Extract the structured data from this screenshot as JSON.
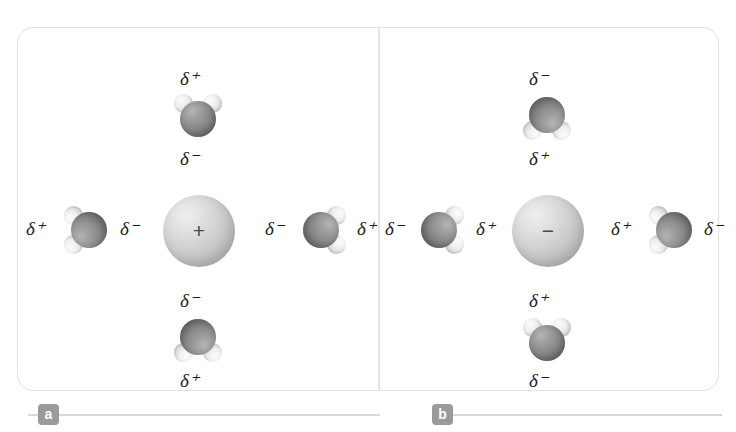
{
  "figure": {
    "background_color": "#ffffff",
    "frame_color": "#e2e2e2",
    "badge_color": "#9a9a9a",
    "oxygen_color": "#8a8a8a",
    "hydrogen_color": "#eeeeee",
    "ion_color": "#cfcfcf",
    "delta_plus": "δ⁺",
    "delta_minus": "δ⁻"
  },
  "panels": [
    {
      "id": "a",
      "label": "a",
      "ion": {
        "name": "cation",
        "sign": "+",
        "charge": "positive",
        "diameter_px": 72
      },
      "molecules": [
        {
          "position": "top",
          "molecule": "water",
          "orientation": "hydrogens-up",
          "outer_label": "δ⁺",
          "inner_label": "δ⁻",
          "rotation_deg": 0
        },
        {
          "position": "left",
          "molecule": "water",
          "orientation": "hydrogens-left",
          "outer_label": "δ⁺",
          "inner_label": "δ⁻",
          "rotation_deg": 270
        },
        {
          "position": "right",
          "molecule": "water",
          "orientation": "hydrogens-right",
          "outer_label": "δ⁺",
          "inner_label": "δ⁻",
          "rotation_deg": 90
        },
        {
          "position": "bottom",
          "molecule": "water",
          "orientation": "hydrogens-down",
          "outer_label": "δ⁺",
          "inner_label": "δ⁻",
          "rotation_deg": 180
        }
      ],
      "labels": {
        "top_outer": "δ⁺",
        "top_inner": "δ⁻",
        "left_outer": "δ⁺",
        "left_inner": "δ⁻",
        "right_inner": "δ⁻",
        "right_outer": "δ⁺",
        "bottom_inner": "δ⁻",
        "bottom_outer": "δ⁺"
      }
    },
    {
      "id": "b",
      "label": "b",
      "ion": {
        "name": "anion",
        "sign": "−",
        "charge": "negative",
        "diameter_px": 72
      },
      "molecules": [
        {
          "position": "top",
          "molecule": "water",
          "orientation": "hydrogens-down",
          "outer_label": "δ⁻",
          "inner_label": "δ⁺",
          "rotation_deg": 180
        },
        {
          "position": "left",
          "molecule": "water",
          "orientation": "hydrogens-right",
          "outer_label": "δ⁻",
          "inner_label": "δ⁺",
          "rotation_deg": 90
        },
        {
          "position": "right",
          "molecule": "water",
          "orientation": "hydrogens-left",
          "outer_label": "δ⁻",
          "inner_label": "δ⁺",
          "rotation_deg": 270
        },
        {
          "position": "bottom",
          "molecule": "water",
          "orientation": "hydrogens-up",
          "outer_label": "δ⁻",
          "inner_label": "δ⁺",
          "rotation_deg": 0
        }
      ],
      "labels": {
        "top_outer": "δ⁻",
        "top_inner": "δ⁺",
        "left_outer": "δ⁻",
        "left_inner": "δ⁺",
        "right_inner": "δ⁺",
        "right_outer": "δ⁻",
        "bottom_inner": "δ⁺",
        "bottom_outer": "δ⁻"
      }
    }
  ]
}
